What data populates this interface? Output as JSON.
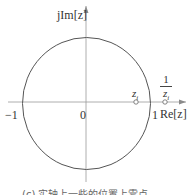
{
  "diagram": {
    "type": "z-plane unit circle",
    "axis_labels": {
      "imag": "jIm[z]",
      "real": "Re[z]"
    },
    "tick_labels": {
      "neg_one": "−1",
      "zero": "0",
      "one": "1"
    },
    "points": [
      {
        "label": "z_i",
        "display": "z",
        "sub": "i",
        "position": "inside unit circle on real axis"
      },
      {
        "label": "1/z_i",
        "numerator": "1",
        "denominator": "z",
        "sub": "i",
        "position": "outside unit circle on real axis"
      }
    ],
    "caption": "(c) 实轴上一些的位置上零点",
    "colors": {
      "stroke": "#555555",
      "axis": "#9a9a9a",
      "text": "#333333"
    }
  }
}
